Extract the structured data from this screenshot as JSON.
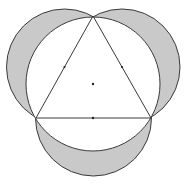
{
  "figure": {
    "colors": {
      "lune_fill": "#c9c9c9",
      "stroke": "#3a3a3a",
      "background": "#ffffff",
      "dot": "#222222"
    },
    "triangle": {
      "vertices": [
        [
          93,
          16
        ],
        [
          36,
          118
        ],
        [
          151,
          118
        ]
      ]
    },
    "circumcircle": {
      "center": [
        93,
        84
      ],
      "radius": 67
    },
    "semicircles": [
      {
        "side": "left",
        "center": [
          64.5,
          67
        ],
        "radius": 58
      },
      {
        "side": "right",
        "center": [
          122,
          67
        ],
        "radius": 58
      },
      {
        "side": "bottom",
        "center": [
          93.5,
          118
        ],
        "radius": 58
      }
    ],
    "marked_points": [
      {
        "name": "center",
        "at": [
          93,
          84
        ]
      },
      {
        "name": "midpoint-left-side",
        "at": [
          64.5,
          67
        ]
      },
      {
        "name": "midpoint-right-side",
        "at": [
          122,
          67
        ]
      },
      {
        "name": "midpoint-bottom-side",
        "at": [
          93.5,
          118
        ]
      }
    ]
  }
}
